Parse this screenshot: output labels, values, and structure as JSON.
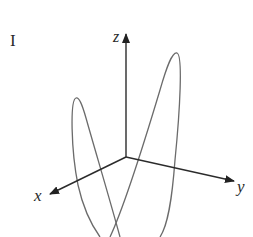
{
  "figure": {
    "panel_label": "I",
    "axes": {
      "x_label": "x",
      "y_label": "y",
      "z_label": "z"
    },
    "curve": {
      "description": "3D space curve with two tall loops crossing near bottom",
      "stroke_color": "#6a6a6a"
    },
    "axis_color": "#333333"
  }
}
